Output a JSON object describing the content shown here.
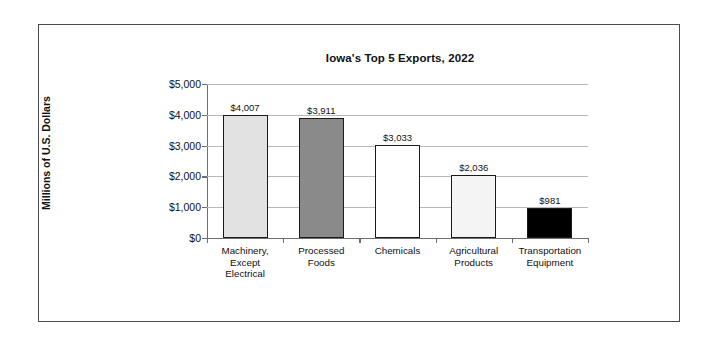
{
  "frame": {
    "border_color": "#4a4a52"
  },
  "chart_data": {
    "type": "bar",
    "title": "Iowa's Top 5 Exports, 2022",
    "xlabel": "",
    "ylabel": "Millions of U.S. Dollars",
    "ylim": [
      0,
      5000
    ],
    "ytick_values": [
      0,
      1000,
      2000,
      3000,
      4000,
      5000
    ],
    "ytick_labels": [
      "$0",
      "$1,000",
      "$2,000",
      "$3,000",
      "$4,000",
      "$5,000"
    ],
    "grid": "horizontal",
    "legend": "none",
    "categories": [
      "Machinery, Except Electrical",
      "Processed Foods",
      "Chemicals",
      "Agricultural Products",
      "Transportation Equipment"
    ],
    "category_label_lines": [
      [
        "Machinery,",
        "Except",
        "Electrical"
      ],
      [
        "Processed",
        "Foods"
      ],
      [
        "Chemicals"
      ],
      [
        "Agricultural",
        "Products"
      ],
      [
        "Transportation",
        "Equipment"
      ]
    ],
    "values": [
      4007,
      3911,
      3033,
      2036,
      981
    ],
    "value_labels": [
      "$4,007",
      "$3,911",
      "$3,033",
      "$2,036",
      "$981"
    ],
    "bar_colors": [
      "#e2e2e2",
      "#8a8a8a",
      "#ffffff",
      "#f4f4f4",
      "#000000"
    ],
    "bar_edge_color": "#1a1a1a"
  }
}
